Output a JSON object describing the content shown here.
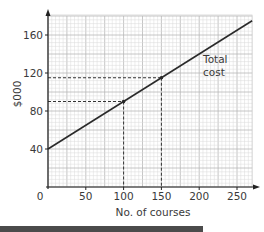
{
  "chart_data": {
    "type": "line",
    "title": "",
    "xlabel": "No. of courses",
    "ylabel": "$000",
    "xlim": [
      0,
      270
    ],
    "ylim": [
      0,
      180
    ],
    "grid": true,
    "x_ticks": [
      "0",
      "50",
      "100",
      "150",
      "200",
      "250"
    ],
    "y_ticks": [
      "40",
      "80",
      "120",
      "160"
    ],
    "series": [
      {
        "name": "Total cost",
        "x": [
          0,
          270
        ],
        "values": [
          40,
          175
        ]
      }
    ],
    "annotations": [
      {
        "text": "Total cost",
        "x": 205,
        "y": 125
      },
      {
        "type": "point",
        "x": 100,
        "y": 90,
        "dashed_guides": true
      },
      {
        "type": "point",
        "x": 150,
        "y": 115,
        "dashed_guides": true
      }
    ],
    "legend": "none"
  },
  "labels": {
    "xlabel": "No. of courses",
    "ylabel": "$000",
    "origin": "0",
    "annotation_line1": "Total",
    "annotation_line2": "cost"
  }
}
